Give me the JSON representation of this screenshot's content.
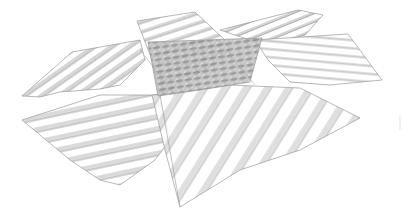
{
  "image": {
    "description": "Pencil-style sketch of overlapping hatched wave planes converging on a textured central region",
    "background": "#ffffff",
    "line_color": "#8a8a8a",
    "dark_texture_color": "#6e6e6e"
  },
  "planes": [
    {
      "name": "left-wave-plane",
      "points": "22,96 72,52 140,40 145,60 120,85 100,89 60,92 40,97"
    },
    {
      "name": "top-center-plane",
      "points": "137,21 195,12 225,40 230,55 160,95 152,60"
    },
    {
      "name": "top-right-plane",
      "points": "220,30 298,10 323,15 305,35 280,42 250,40"
    },
    {
      "name": "right-wave-plane",
      "points": "255,40 348,34 382,80 330,85 290,82 268,60"
    },
    {
      "name": "bottom-left-plane",
      "points": "22,120 100,95 160,95 170,140 155,160 120,185 100,180 70,160"
    },
    {
      "name": "bottom-right-plane",
      "points": "152,95 230,85 300,88 360,118 300,150 240,170 180,207 165,150"
    },
    {
      "name": "central-texture",
      "points": "148,42 262,38 250,82 200,90 158,96"
    }
  ]
}
